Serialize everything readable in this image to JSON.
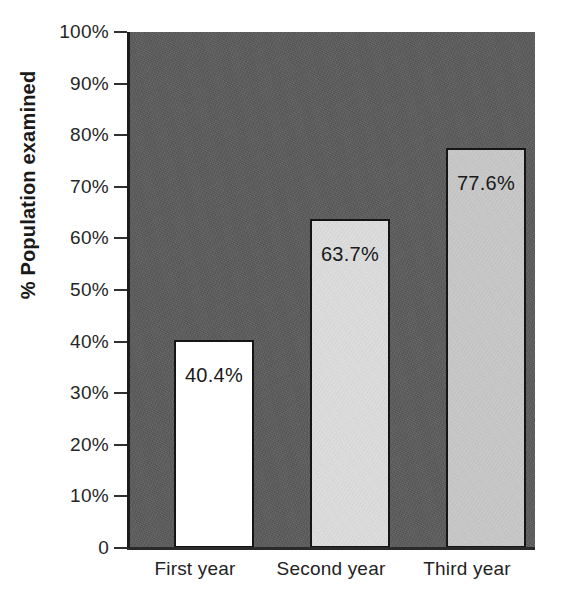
{
  "chart_data": {
    "type": "bar",
    "title": "",
    "subtitle": "",
    "xlabel": "",
    "ylabel": "% Population examined",
    "categories": [
      "First year",
      "Second year",
      "Third year"
    ],
    "values": [
      40.4,
      63.7,
      77.6
    ],
    "value_labels": [
      "40.4%",
      "63.7%",
      "77.6%"
    ],
    "ylim": [
      0,
      100
    ],
    "ytick_values": [
      0,
      10,
      20,
      30,
      40,
      50,
      60,
      70,
      80,
      90,
      100
    ],
    "ytick_labels": [
      "0",
      "10%",
      "20%",
      "30%",
      "40%",
      "50%",
      "60%",
      "70%",
      "80%",
      "90%",
      "100%"
    ],
    "grid": false,
    "legend": "none",
    "bar_colors": [
      "#ffffff",
      "#dedede",
      "#c9c9c9"
    ],
    "bar_edge_color": "#151515",
    "plot_background": "#5d5d5d",
    "figure_background": "#ffffff",
    "axis_color": "#1c1c1c",
    "text_color": "#232323"
  },
  "axes": {
    "y_title": "% Population examined"
  }
}
